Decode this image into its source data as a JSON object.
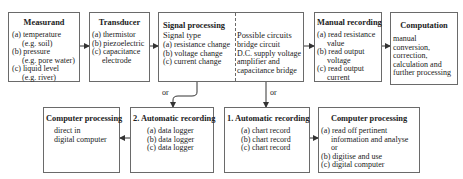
{
  "top_row": {
    "measurand": {
      "title": "Measurand",
      "lines": [
        "(a) temperature",
        "(e.g. soil)",
        "(b) pressure",
        "(e.g. pore water)",
        "(c) liquid level",
        "(e.g. river)"
      ]
    },
    "transducer": {
      "title": "Transducer",
      "lines": [
        "(a) thermistor",
        "(b) piezoelectric",
        "(c) capacitance",
        "electrode"
      ]
    },
    "signal_processing": {
      "title": "Signal processing",
      "left_header": "Signal type",
      "left_lines": [
        "(a) resistance change",
        "(b) voltage change",
        "(c) current change"
      ],
      "right_header": "Possible circuits",
      "right_lines": [
        "bridge circuit",
        "D.C. supply voltage",
        "amplifier and",
        "capacitance bridge"
      ]
    },
    "manual_recording": {
      "title": "Manual recording",
      "lines": [
        "(a) read resistance",
        "value",
        "(b) read output",
        "voltage",
        "(c) read output",
        "current"
      ]
    },
    "computation": {
      "title": "Computation",
      "lines": [
        "manual",
        "conversion,",
        "correction,",
        "calculation and",
        "further processing"
      ]
    }
  },
  "bottom_row": {
    "computer_processing_direct": {
      "title": "Computer processing",
      "lines": [
        "direct in",
        "digital computer"
      ]
    },
    "automatic_recording_2": {
      "title": "2. Automatic recording",
      "lines": [
        "(a) data logger",
        "(b) data logger",
        "(c) data logger"
      ]
    },
    "automatic_recording_1": {
      "title": "1. Automatic recording",
      "lines": [
        "(a) chart record",
        "(b) chart record",
        "(c) chart record"
      ]
    },
    "computer_processing_analyse": {
      "title": "Computer processing",
      "lines": [
        "(a) read off pertinent",
        "information and analyse",
        "or",
        "(b) digitise and use",
        "(c) digital computer"
      ]
    }
  },
  "connectors": {
    "or_left": "or",
    "or_right": "or"
  }
}
